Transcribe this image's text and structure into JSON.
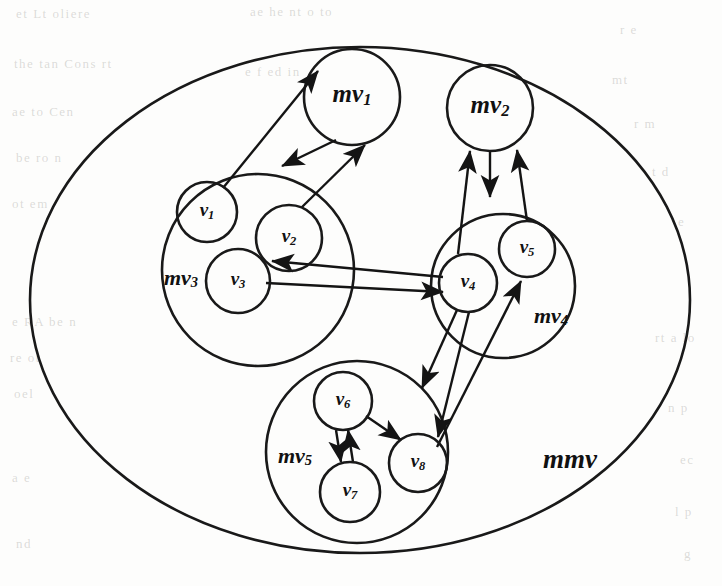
{
  "figure": {
    "kind": "nested-graph-diagram",
    "background_color": "#fdfdfc",
    "line_color": "#141414"
  },
  "root": {
    "label": "mmv",
    "name": "outer-boundary-mmv",
    "cx": 360,
    "cy": 300,
    "rx": 330,
    "ry": 253,
    "label_x": 570,
    "label_y": 462
  },
  "macro_vertices": [
    {
      "id": "mv1",
      "base": "mv",
      "sub": "1",
      "cx": 352,
      "cy": 97,
      "r": 48,
      "label_x": 352,
      "label_y": 96,
      "kind": "leaf-macro"
    },
    {
      "id": "mv2",
      "base": "mv",
      "sub": "2",
      "cx": 490,
      "cy": 108,
      "r": 43,
      "label_x": 490,
      "label_y": 107,
      "kind": "leaf-macro"
    },
    {
      "id": "mv3",
      "base": "mv",
      "sub": "3",
      "cx": 258,
      "cy": 270,
      "r": 96,
      "label_x": 181,
      "label_y": 280,
      "kind": "container"
    },
    {
      "id": "mv4",
      "base": "mv",
      "sub": "4",
      "cx": 503,
      "cy": 286,
      "r": 72,
      "label_x": 551,
      "label_y": 318,
      "kind": "container"
    },
    {
      "id": "mv5",
      "base": "mv",
      "sub": "5",
      "cx": 357,
      "cy": 452,
      "r": 91,
      "label_x": 295,
      "label_y": 458,
      "kind": "container"
    }
  ],
  "vertices": [
    {
      "id": "v1",
      "base": "v",
      "sub": "1",
      "cx": 207,
      "cy": 212,
      "r": 30,
      "parent": "mv3"
    },
    {
      "id": "v2",
      "base": "v",
      "sub": "2",
      "cx": 289,
      "cy": 238,
      "r": 33,
      "parent": "mv3"
    },
    {
      "id": "v3",
      "base": "v",
      "sub": "3",
      "cx": 238,
      "cy": 281,
      "r": 32,
      "parent": "mv3"
    },
    {
      "id": "v4",
      "base": "v",
      "sub": "4",
      "cx": 468,
      "cy": 283,
      "r": 29,
      "parent": "mv4"
    },
    {
      "id": "v5",
      "base": "v",
      "sub": "5",
      "cx": 527,
      "cy": 249,
      "r": 28,
      "parent": "mv4"
    },
    {
      "id": "v6",
      "base": "v",
      "sub": "6",
      "cx": 343,
      "cy": 401,
      "r": 29,
      "parent": "mv5"
    },
    {
      "id": "v7",
      "base": "v",
      "sub": "7",
      "cx": 350,
      "cy": 492,
      "r": 30,
      "parent": "mv5"
    },
    {
      "id": "v8",
      "base": "v",
      "sub": "8",
      "cx": 418,
      "cy": 463,
      "r": 29,
      "parent": "mv5"
    }
  ],
  "edges": [
    {
      "id": "e1",
      "from": "v1",
      "to": "mv1",
      "x1": 223,
      "y1": 188,
      "x2": 318,
      "y2": 71,
      "arrow": "end"
    },
    {
      "id": "e2",
      "from": "mv1",
      "to": "v2",
      "x1": 336,
      "y1": 140,
      "x2": 282,
      "y2": 166,
      "arrow": "end"
    },
    {
      "id": "e3",
      "from": "v2",
      "to": "mv1",
      "x1": 302,
      "y1": 207,
      "x2": 365,
      "y2": 145,
      "arrow": "end"
    },
    {
      "id": "e4",
      "from": "v4",
      "to": "mv2",
      "x1": 458,
      "y1": 254,
      "x2": 470,
      "y2": 151,
      "arrow": "end"
    },
    {
      "id": "e5",
      "from": "mv2",
      "to": "mv4",
      "x1": 490,
      "y1": 151,
      "x2": 490,
      "y2": 197,
      "arrow": "end"
    },
    {
      "id": "e6",
      "from": "v5",
      "to": "mv2",
      "x1": 527,
      "y1": 221,
      "x2": 517,
      "y2": 150,
      "arrow": "end"
    },
    {
      "id": "e7",
      "from": "v4",
      "to": "mv3",
      "x1": 443,
      "y1": 277,
      "x2": 272,
      "y2": 261,
      "arrow": "end"
    },
    {
      "id": "e8",
      "from": "v3",
      "to": "v4",
      "x1": 266,
      "y1": 283,
      "x2": 443,
      "y2": 292,
      "arrow": "end"
    },
    {
      "id": "e9",
      "from": "v4",
      "to": "mv5",
      "x1": 457,
      "y1": 310,
      "x2": 422,
      "y2": 388,
      "arrow": "end"
    },
    {
      "id": "e10",
      "from": "v4",
      "to": "v8",
      "x1": 469,
      "y1": 312,
      "x2": 438,
      "y2": 437,
      "arrow": "end"
    },
    {
      "id": "e11",
      "from": "v8",
      "to": "v5",
      "x1": 437,
      "y1": 447,
      "x2": 521,
      "y2": 281,
      "arrow": "end"
    },
    {
      "id": "e12",
      "from": "v6",
      "to": "v8",
      "x1": 366,
      "y1": 416,
      "x2": 401,
      "y2": 440,
      "arrow": "end"
    },
    {
      "id": "e13",
      "from": "v6",
      "to": "v7",
      "x1": 336,
      "y1": 430,
      "x2": 341,
      "y2": 462,
      "arrow": "end"
    },
    {
      "id": "e14",
      "from": "v7",
      "to": "v6",
      "x1": 353,
      "y1": 462,
      "x2": 348,
      "y2": 430,
      "arrow": "end"
    }
  ],
  "ghost_text": [
    {
      "text": "et Lt oliere",
      "x": 16,
      "y": 6
    },
    {
      "text": "ae he  nt o to",
      "x": 250,
      "y": 4
    },
    {
      "text": "r  e",
      "x": 620,
      "y": 22
    },
    {
      "text": "the tan  Cons  rt",
      "x": 14,
      "y": 56
    },
    {
      "text": "e f  ed  in",
      "x": 245,
      "y": 64
    },
    {
      "text": "mt",
      "x": 612,
      "y": 72
    },
    {
      "text": "ae  to  Cen",
      "x": 12,
      "y": 104
    },
    {
      "text": "r  m",
      "x": 634,
      "y": 116
    },
    {
      "text": "be  ro  n",
      "x": 16,
      "y": 150
    },
    {
      "text": "t  d",
      "x": 652,
      "y": 164
    },
    {
      "text": "ot  em",
      "x": 12,
      "y": 196
    },
    {
      "text": "e",
      "x": 678,
      "y": 214
    },
    {
      "text": "e  RA  be  n",
      "x": 12,
      "y": 314
    },
    {
      "text": "re  ot",
      "x": 10,
      "y": 350
    },
    {
      "text": "oel",
      "x": 14,
      "y": 386
    },
    {
      "text": "rt  a  lo",
      "x": 655,
      "y": 330
    },
    {
      "text": "n  p",
      "x": 668,
      "y": 400
    },
    {
      "text": "ec",
      "x": 680,
      "y": 452
    },
    {
      "text": "a  e",
      "x": 12,
      "y": 470
    },
    {
      "text": "l  p",
      "x": 675,
      "y": 504
    },
    {
      "text": "nd",
      "x": 16,
      "y": 536
    },
    {
      "text": "g",
      "x": 684,
      "y": 546
    }
  ]
}
